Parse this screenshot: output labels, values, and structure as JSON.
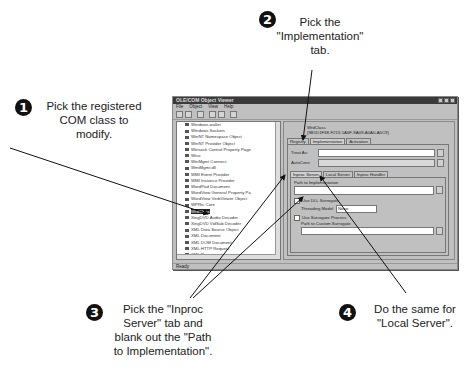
{
  "callouts": [
    {
      "num": "1",
      "text": [
        "Pick the registered",
        "COM class to",
        "modify."
      ]
    },
    {
      "num": "2",
      "text": [
        "Pick the",
        "\"Implementation\"",
        "tab."
      ]
    },
    {
      "num": "3",
      "text": [
        "Pick the \"Inproc",
        "Server\" tab and",
        "blank out the \"Path",
        "to Implementation\"."
      ]
    },
    {
      "num": "4",
      "text": [
        "Do the same for",
        "\"Local Server\"."
      ]
    }
  ],
  "window": {
    "title": "OLE/COM Object Viewer",
    "menu": [
      "File",
      "Object",
      "View",
      "Help"
    ],
    "toolbar_icons": [
      "connect-icon",
      "disconnect-icon",
      "expert-icon",
      "copy-icon",
      "view-icon",
      "registry-icon"
    ],
    "tree_items": [
      "Windows wallet",
      "Windows Sockets",
      "WinNT Namespace Object",
      "WinNT Provider Object",
      "Winsock Control Property Page",
      "Wise",
      "WinMgmt Connect",
      "WmiMgmt.dll",
      "WMI Event Provider",
      "WMI Instance Provider",
      "WordPad Document",
      "WordView General Property Pa",
      "WordView VerbViewer Object",
      "WPRtc Core",
      "WrdClass",
      "XingDVD Audio Decoder",
      "XingDVD VidSub Decoder",
      "XML Data Source Object",
      "XML Document",
      "XML DOM Document",
      "XML HTTP Request",
      "XML Parser",
      "XML Script Source"
    ],
    "selected_index": 14,
    "panel": {
      "class_label": "WrdClass",
      "clsid": "{9B1D1F68-F213-1A6F-9A09-A0A0-A0C9}",
      "outer_tabs": [
        "Registry",
        "Implementation",
        "Activation"
      ],
      "active_outer_tab": 1,
      "treat_as_label": "Treat As:",
      "auto_convert_label": "AutoConv",
      "inner_tabs": [
        "Inproc Server",
        "Local Server",
        "Inproc Handler"
      ],
      "active_inner_tab": 0,
      "path_label": "Path to Implementation",
      "path_value": "",
      "use_surrogate_label": "Use DLL Surrogate",
      "threading_label": "Threading Model",
      "threading_value": "None",
      "custom_surrogate_label": "Use Surrogate Process",
      "custom_path_label": "Path to Custom Surrogate"
    },
    "status": "Ready"
  }
}
